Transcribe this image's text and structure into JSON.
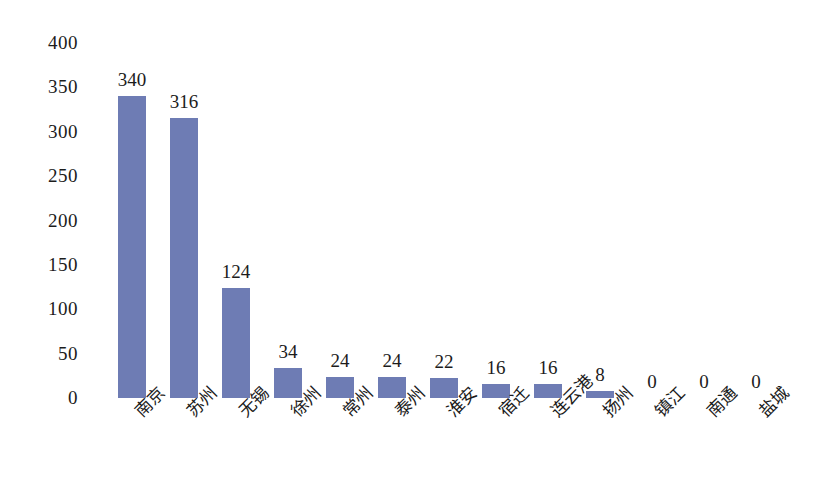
{
  "chart_data": {
    "type": "bar",
    "title": "",
    "subtitle": "",
    "xlabel": "",
    "ylabel": "",
    "categories": [
      "南京",
      "苏州",
      "无锡",
      "徐州",
      "常州",
      "泰州",
      "淮安",
      "宿迁",
      "连云港",
      "扬州",
      "镇江",
      "南通",
      "盐城"
    ],
    "values": [
      340,
      316,
      124,
      34,
      24,
      24,
      22,
      16,
      16,
      8,
      0,
      0,
      0
    ],
    "data_labels": [
      "340",
      "316",
      "124",
      "34",
      "24",
      "24",
      "22",
      "16",
      "16",
      "8",
      "0",
      "0",
      "0"
    ],
    "ylim": [
      0,
      400
    ],
    "ytick_values": [
      0,
      50,
      100,
      150,
      200,
      250,
      300,
      350,
      400
    ],
    "ytick_labels": [
      "0",
      "50",
      "100",
      "150",
      "200",
      "250",
      "300",
      "350",
      "400"
    ],
    "grid": false,
    "legend": null,
    "legend_position": "none",
    "bar_color": "#6e7cb4",
    "background_color": "#ffffff",
    "text_color": "#1c1c1c",
    "xtick_label_rotation": -45
  }
}
